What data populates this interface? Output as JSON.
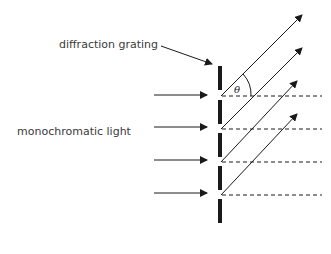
{
  "labels": {
    "grating": "diffraction grating",
    "light": "monochromatic light",
    "angle": "θ"
  },
  "colors": {
    "line": "#1a1a1a",
    "text": "#3a3a3a"
  }
}
